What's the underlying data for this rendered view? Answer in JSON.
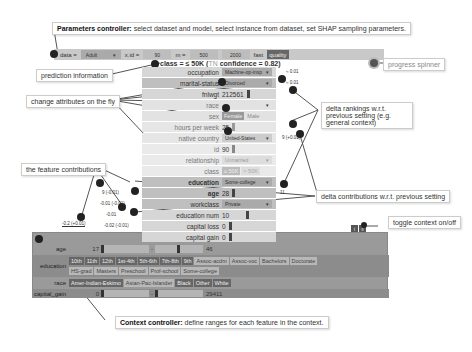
{
  "callouts": {
    "parameters": {
      "bold": "Parameters controller:",
      "text": " select dataset and model, select instance from dataset, set SHAP sampling parameters."
    },
    "prediction_info": "prediction information",
    "progress_spinner": "progress spinner",
    "change_attributes": "change attributes on the fly",
    "delta_rankings": "delta rankings w.r.t. previous setting (e.g. general context)",
    "feature_contributions": "the feature contributions",
    "delta_contributions": "delta contributions w.r.t. previous setting",
    "toggle_context": "toggle context on/off",
    "context": {
      "bold": "Context controller:",
      "text": " define ranges for each feature in the context."
    }
  },
  "params": {
    "data_label": "data =",
    "dataset": "Adult",
    "xid_label": "x.id =",
    "xid": "90",
    "m_label": "m =",
    "m_min": "500",
    "m_max": "2000",
    "fast": "fast",
    "quality": "quality"
  },
  "prediction": {
    "prefix": "class = ≤ 50K (",
    "tn": "TN",
    "suffix": " confidence = 0.82)"
  },
  "features": [
    {
      "name": "occupation",
      "value": "Machine-op-insp",
      "type": "select",
      "rank": "≈ 0.01"
    },
    {
      "name": "marital-status",
      "value": "Divorced",
      "type": "select",
      "rank": "≈ 0.01"
    },
    {
      "name": "fnlwgt",
      "value": "212561",
      "type": "number"
    },
    {
      "name": "race",
      "value": "",
      "type": "select"
    },
    {
      "name": "sex",
      "value": "Female",
      "alt": "Male",
      "type": "toggle"
    },
    {
      "name": "hours per week",
      "value": "25",
      "type": "number"
    },
    {
      "name": "native country",
      "value": "United-States",
      "type": "select",
      "rank": "9 (+0.01)"
    },
    {
      "name": "id",
      "value": "90",
      "type": "number"
    },
    {
      "name": "relationship",
      "value": "Unmarried",
      "type": "select"
    },
    {
      "name": "class",
      "value": "≤ 50K",
      "alt": "> 50K",
      "type": "toggle"
    },
    {
      "name": "education",
      "value": "Some-college",
      "type": "select"
    },
    {
      "name": "age",
      "value": "28",
      "type": "number",
      "contrib": "9 (-0.01)",
      "rank": "11"
    },
    {
      "name": "workclass",
      "value": "Private",
      "type": "select",
      "contrib": "-0.01 (-0.01)"
    },
    {
      "name": "education num",
      "value": "10",
      "type": "number",
      "contrib": "-0.01"
    },
    {
      "name": "capital loss",
      "value": "0",
      "type": "number",
      "contrib": "-0.02 (-0.01)"
    },
    {
      "name": "capital gain",
      "value": "0",
      "type": "number",
      "contrib": "-0.2 (+0.01)"
    }
  ],
  "context": {
    "toggle": [
      "t",
      "s"
    ],
    "age": {
      "label": "age",
      "min": "17",
      "max": "46"
    },
    "education": {
      "label": "education",
      "options_row1": [
        "10th",
        "11th",
        "12th",
        "1st-4th",
        "5th-6th",
        "7th-8th",
        "9th",
        "Assoc-acdm",
        "Assoc-voc",
        "Bachelors",
        "Doctorate"
      ],
      "options_row2": [
        "HS-grad",
        "Masters",
        "Preschool",
        "Prof-school",
        "Some-college"
      ],
      "selected": [
        "10th",
        "11th",
        "12th",
        "1st-4th",
        "5th-6th",
        "7th-8th",
        "9th"
      ]
    },
    "race": {
      "label": "race",
      "options": [
        "Amer-Indian-Eskimo",
        "Asian-Pac-Islander",
        "Black",
        "Other",
        "White"
      ],
      "selected": [
        "Amer-Indian-Eskimo",
        "Black",
        "Other",
        "White"
      ]
    },
    "capital_gain": {
      "label": "capital_gain",
      "min": "0",
      "max": "29411"
    }
  }
}
